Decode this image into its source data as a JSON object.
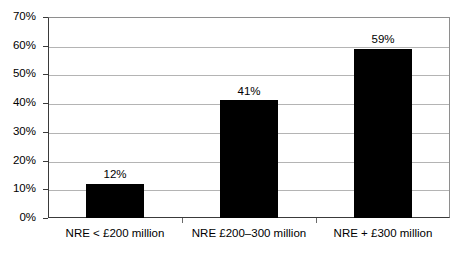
{
  "chart_data": {
    "type": "bar",
    "title": "",
    "subtitle": "",
    "xlabel": "",
    "ylabel": "",
    "categories": [
      "NRE < £200 million",
      "NRE £200–300 million",
      "NRE + £300 million"
    ],
    "values": [
      12,
      41,
      59
    ],
    "value_labels": [
      "12%",
      "41%",
      "59%"
    ],
    "ylim": [
      0,
      70
    ],
    "ytick_values": [
      0,
      10,
      20,
      30,
      40,
      50,
      60,
      70
    ],
    "ytick_labels": [
      "0%",
      "10%",
      "20%",
      "30%",
      "40%",
      "50%",
      "60%",
      "70%"
    ],
    "grid": true,
    "grid_orientation": "horizontal",
    "legend": false,
    "legend_position": "none",
    "bar_color": "#000000",
    "grid_color": "#b4b4b4",
    "axis_color": "#3a3a3a",
    "background_color": "#ffffff"
  }
}
